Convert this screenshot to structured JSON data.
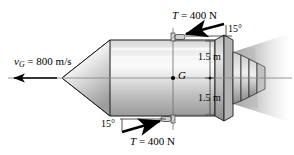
{
  "figure": {
    "name": "rocket-free-body-diagram",
    "labels": {
      "velocity": {
        "symbol": "v",
        "subscript": "G",
        "equals": " = ",
        "value": "800 m/s",
        "full": "v_G = 800 m/s"
      },
      "thrust_top": {
        "symbol": "T",
        "equals": " = ",
        "value": "400 N",
        "full": "T = 400 N"
      },
      "thrust_bottom": {
        "symbol": "T",
        "equals": " = ",
        "value": "400 N",
        "full": "T = 400 N"
      },
      "angle_top": "15°",
      "angle_bottom": "15°",
      "dim_top": "1.5 m",
      "dim_bottom": "1.5 m",
      "center_of_mass": "G"
    },
    "colors": {
      "outline": "#000000",
      "body_light": "#f2f2f2",
      "body_mid": "#c9c9c9",
      "body_dark": "#8f8f8f",
      "axis": "#7a7a7a",
      "dimension": "#4d4d4d",
      "plume": "#a8a8a8",
      "background": "#ffffff"
    }
  }
}
